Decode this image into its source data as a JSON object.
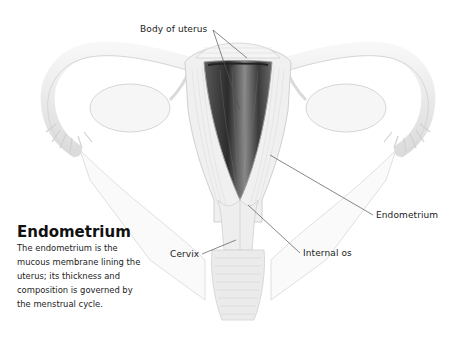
{
  "diagram": {
    "labels": {
      "body_of_uterus": "Body of uterus",
      "endometrium": "Endometrium",
      "internal_os": "Internal os",
      "cervix": "Cervix"
    }
  },
  "caption": {
    "title": "Endometrium",
    "text": "The endometrium is the mucous membrane lining the uterus; its thickness and composition is governed by the menstrual cycle."
  },
  "colors": {
    "tissue_light": "#eeeeee",
    "tissue_outline": "#d4d4d4",
    "cavity_dark": "#3a3a3a",
    "leader_line": "#555555",
    "text": "#222222"
  }
}
